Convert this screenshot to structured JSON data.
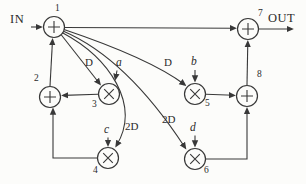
{
  "diagram": {
    "input_label": "IN",
    "output_label": "OUT",
    "nodes": [
      {
        "id": "1",
        "op": "adder",
        "symbol": "+"
      },
      {
        "id": "2",
        "op": "adder",
        "symbol": "+"
      },
      {
        "id": "3",
        "op": "multiplier",
        "symbol": "×"
      },
      {
        "id": "4",
        "op": "multiplier",
        "symbol": "×"
      },
      {
        "id": "5",
        "op": "multiplier",
        "symbol": "×"
      },
      {
        "id": "6",
        "op": "multiplier",
        "symbol": "×"
      },
      {
        "id": "7",
        "op": "adder",
        "symbol": "+"
      },
      {
        "id": "8",
        "op": "adder",
        "symbol": "+"
      }
    ],
    "coefficients": {
      "a": "a",
      "b": "b",
      "c": "c",
      "d": "d"
    },
    "edges": [
      {
        "from": "IN",
        "to": "1",
        "label": ""
      },
      {
        "from": "1",
        "to": "7",
        "label": ""
      },
      {
        "from": "2",
        "to": "1",
        "label": ""
      },
      {
        "from": "3",
        "to": "2",
        "label": ""
      },
      {
        "from": "4",
        "to": "2",
        "label": ""
      },
      {
        "from": "1",
        "to": "3",
        "label": "D"
      },
      {
        "from": "1",
        "to": "5",
        "label": "D"
      },
      {
        "from": "1",
        "to": "4",
        "label": "2D"
      },
      {
        "from": "1",
        "to": "6",
        "label": "2D"
      },
      {
        "from": "a",
        "to": "3",
        "label": ""
      },
      {
        "from": "b",
        "to": "5",
        "label": ""
      },
      {
        "from": "c",
        "to": "4",
        "label": ""
      },
      {
        "from": "d",
        "to": "6",
        "label": ""
      },
      {
        "from": "5",
        "to": "8",
        "label": ""
      },
      {
        "from": "6",
        "to": "8",
        "label": ""
      },
      {
        "from": "8",
        "to": "7",
        "label": ""
      },
      {
        "from": "7",
        "to": "OUT",
        "label": ""
      }
    ],
    "colors": {
      "ink": "#383838",
      "paper": "#fcfcfa"
    }
  }
}
